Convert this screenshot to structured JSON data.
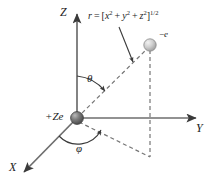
{
  "figure": {
    "width": 215,
    "height": 187,
    "background_color": "#ffffff"
  },
  "axes": {
    "z": {
      "label": "Z",
      "direction": "up"
    },
    "y": {
      "label": "Y",
      "direction": "right"
    },
    "x": {
      "label": "X",
      "direction": "down-left"
    },
    "color": "#6e6e6e",
    "arrow_color": "#3a3a3a"
  },
  "angles": [
    {
      "name": "theta",
      "label": "θ",
      "between": "Z-axis and radius vector"
    },
    {
      "name": "phi",
      "label": "φ",
      "between": "X-axis and projection of radius in XY plane"
    }
  ],
  "particles": [
    {
      "name": "nucleus",
      "label": "+Ze",
      "charge_sign": "+",
      "fill_color": "#6b6b6b",
      "position": "origin"
    },
    {
      "name": "electron",
      "label_sign": "−",
      "label_symbol": "e",
      "label": "−e",
      "fill_color": "#c9c9c9",
      "position": "upper-right"
    }
  ],
  "formula": {
    "lhs": "r",
    "equals": "=",
    "open_bracket": "[",
    "terms": [
      {
        "base": "x",
        "exp": "2"
      },
      {
        "base": "y",
        "exp": "2"
      },
      {
        "base": "z",
        "exp": "2"
      }
    ],
    "plus": "+",
    "close_bracket": "]",
    "outer_exponent": "1/2",
    "full_text": "r = [x² + y² + z²]^(1/2)"
  },
  "lines": {
    "radius_vector": {
      "style": "dashed",
      "color": "#707070",
      "from": "nucleus",
      "to": "electron"
    },
    "projection_drop": {
      "style": "dashed",
      "color": "#707070",
      "from": "electron",
      "to": "xy-plane point"
    },
    "projection_in_plane": {
      "style": "dashed",
      "color": "#707070",
      "from": "nucleus",
      "to": "xy-plane point"
    },
    "leader": {
      "style": "solid",
      "color": "#3a3a3a",
      "from": "formula",
      "to": "radius vector"
    }
  },
  "colors": {
    "stroke": "#6e6e6e",
    "dark_stroke": "#3a3a3a",
    "text": "#1c1c1c",
    "nucleus": "#6b6b6b",
    "electron": "#c9c9c9"
  }
}
